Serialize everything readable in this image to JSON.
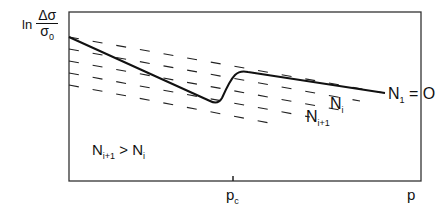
{
  "diagram": {
    "title": "",
    "y_axis": {
      "prefix": "ln",
      "numerator": "Δσ",
      "denominator": "σ",
      "denominator_sub": "0"
    },
    "x_axis": {
      "label": "p",
      "tick_label": "p",
      "tick_label_sub": "c"
    },
    "labels": {
      "n1": {
        "main": "N",
        "sub": "1",
        "suffix": " = O"
      },
      "ni": {
        "main": "N",
        "sub": "i"
      },
      "ni1": {
        "main": "N",
        "sub": "i+1"
      },
      "condition": {
        "left_main": "N",
        "left_sub": "i+1",
        "op": " > ",
        "right_main": "N",
        "right_sub": "i"
      }
    },
    "colors": {
      "ink": "#111111",
      "background": "#ffffff"
    },
    "elements": {
      "frame": "rectangular axes box",
      "dashed_lines": "family of 5 parallel decreasing dashed lines (different N)",
      "solid_curve": "follows lower line, dips before p_c, jumps up to N1=0 line after p_c"
    }
  }
}
